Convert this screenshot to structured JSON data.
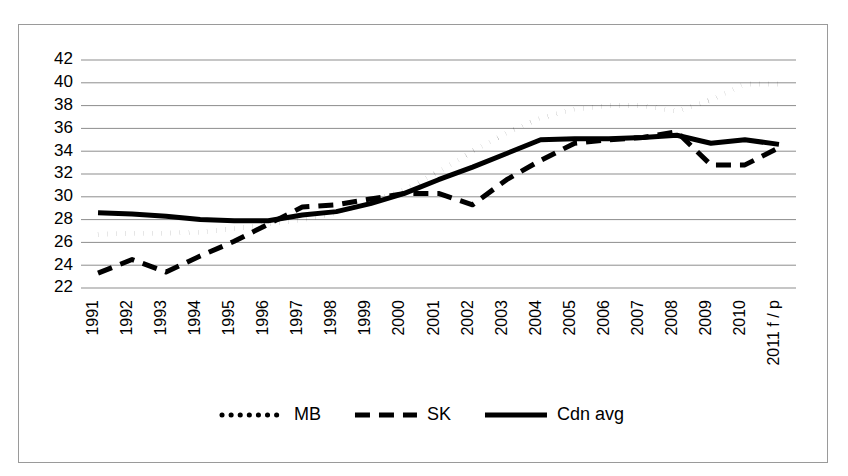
{
  "chart_data": {
    "type": "line",
    "title": "",
    "subtitle": "",
    "xlabel": "",
    "ylabel": "",
    "ylim": [
      22,
      42
    ],
    "ytick_step": 2,
    "ytick_labels": [
      "22",
      "24",
      "26",
      "28",
      "30",
      "32",
      "34",
      "36",
      "38",
      "40",
      "42"
    ],
    "grid": true,
    "legend_position": "bottom",
    "categories": [
      "1991",
      "1992",
      "1993",
      "1994",
      "1995",
      "1996",
      "1997",
      "1998",
      "1999",
      "2000",
      "2001",
      "2002",
      "2003",
      "2004",
      "2005",
      "2006",
      "2007",
      "2008",
      "2009",
      "2010",
      "2011 f / p"
    ],
    "series": [
      {
        "name": "MB",
        "style": "dotted",
        "color": "#000000",
        "values": [
          26.7,
          26.8,
          26.8,
          26.9,
          27.2,
          27.6,
          28.0,
          28.6,
          29.6,
          30.6,
          32.2,
          34.0,
          35.6,
          36.9,
          37.7,
          38.0,
          38.0,
          37.5,
          38.5,
          39.9,
          39.9
        ]
      },
      {
        "name": "SK",
        "style": "dashed",
        "color": "#000000",
        "values": [
          23.3,
          24.5,
          23.4,
          24.8,
          26.1,
          27.6,
          29.1,
          29.3,
          29.8,
          30.3,
          30.3,
          29.3,
          31.5,
          33.2,
          34.7,
          35.0,
          35.2,
          35.7,
          32.8,
          32.8,
          34.3
        ]
      },
      {
        "name": "Cdn avg",
        "style": "solid",
        "color": "#000000",
        "values": [
          28.6,
          28.5,
          28.3,
          28.0,
          27.9,
          27.9,
          28.4,
          28.7,
          29.4,
          30.3,
          31.5,
          32.6,
          33.8,
          35.0,
          35.1,
          35.1,
          35.2,
          35.4,
          34.7,
          35.0,
          34.6
        ]
      }
    ]
  },
  "legend": {
    "entries": [
      {
        "label": "MB",
        "style": "dotted"
      },
      {
        "label": "SK",
        "style": "dashed"
      },
      {
        "label": "Cdn avg",
        "style": "solid"
      }
    ]
  }
}
